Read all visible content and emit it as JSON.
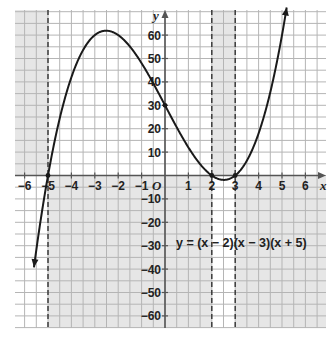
{
  "chart_data": {
    "type": "line",
    "title": "",
    "equation": "y = (x − 2)(x − 3)(x + 5)",
    "function": "cubic",
    "factors": [
      2,
      3,
      -5
    ],
    "xlabel": "x",
    "ylabel": "y",
    "origin_label": "O",
    "xlim": [
      -6.5,
      6.9
    ],
    "ylim": [
      -65,
      70
    ],
    "x_ticks": [
      -6,
      -5,
      -4,
      -3,
      -2,
      -1,
      1,
      2,
      3,
      4,
      5,
      6
    ],
    "x_tick_labels": [
      "−6",
      "−5",
      "−4",
      "−3",
      "−2",
      "−1",
      "1",
      "2",
      "3",
      "4",
      "5",
      "6"
    ],
    "y_ticks": [
      60,
      50,
      40,
      30,
      20,
      10,
      -10,
      -20,
      -30,
      -40,
      -50,
      -60
    ],
    "y_tick_labels": [
      "60",
      "50",
      "40",
      "30",
      "20",
      "10",
      "−10",
      "−20",
      "−30",
      "−40",
      "−50",
      "−60"
    ],
    "grid": true,
    "grid_step_x": 0.5,
    "grid_step_y": 5,
    "roots": [
      -5,
      2,
      3
    ],
    "y_intercept": 30,
    "local_max": {
      "x": -2.5,
      "y": 61.9
    },
    "local_min": {
      "x": 2.5,
      "y": -1.9
    },
    "points": [
      {
        "x": -5,
        "y": 0
      },
      {
        "x": 0,
        "y": 30
      },
      {
        "x": 2,
        "y": 0
      },
      {
        "x": 3,
        "y": 0
      }
    ],
    "dashed_verticals": [
      -5,
      2,
      3
    ],
    "shaded_regions": [
      {
        "x_from": -6.5,
        "x_to": -5,
        "side": "above"
      },
      {
        "x_from": 2,
        "x_to": 3,
        "side": "above"
      },
      {
        "x_from": -5,
        "x_to": 2,
        "side": "below"
      },
      {
        "x_from": 3,
        "x_to": 6.9,
        "side": "below"
      }
    ],
    "colors": {
      "curve": "#1a1a1a",
      "grid": "#b5b5b5",
      "shade": "#e6e6e6",
      "axis": "#555555"
    }
  }
}
